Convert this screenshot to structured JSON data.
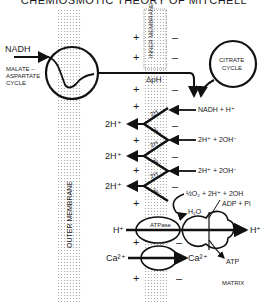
{
  "title": "CHEMIOSMOTIC THEORY OF MITCHELL",
  "membranes": {
    "outer": "OUTER MEMBRANE",
    "inner": "INNER MEMBRANE"
  },
  "left": {
    "nadh": "NADH",
    "shuttle": [
      "MALATE –",
      "ASPARTATE",
      "CYCLE"
    ],
    "protons": [
      "2H⁺",
      "2H⁺",
      "2H⁺",
      "2H⁺"
    ],
    "h_in": "H⁺",
    "ca_in": "Ca²⁺"
  },
  "inner_labels": {
    "delta_ph": "ΔpH",
    "zigzag": [
      "2H",
      "2e⁻",
      "2H",
      "2e⁻",
      "2H",
      "2e⁻"
    ],
    "atpase": "ATPase"
  },
  "right": {
    "citrate": [
      "CITRATE",
      "CYCLE"
    ],
    "reactions": [
      "NADH + H⁺",
      "2H⁺ + 2OH⁻",
      "2H⁺ + 2OH⁻",
      "½O₂ + 2H⁺ + 2OH"
    ],
    "h2o": "H₂O",
    "adp": "ADP + Pi",
    "h_out": "H⁺",
    "ca_out": "Ca²⁺",
    "atp": "ATP",
    "matrix": "MATRIX"
  },
  "signs": {
    "plus": "+",
    "minus": "–"
  }
}
